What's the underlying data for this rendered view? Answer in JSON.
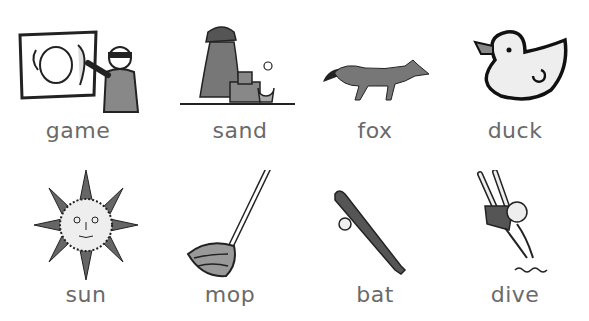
{
  "worksheet": {
    "items": [
      {
        "word": "game",
        "icon": "pin-the-tail-game-icon"
      },
      {
        "word": "sand",
        "icon": "sandcastle-icon"
      },
      {
        "word": "fox",
        "icon": "fox-icon"
      },
      {
        "word": "duck",
        "icon": "rubber-duck-icon"
      },
      {
        "word": "sun",
        "icon": "sun-face-icon"
      },
      {
        "word": "mop",
        "icon": "mop-icon"
      },
      {
        "word": "bat",
        "icon": "baseball-bat-icon"
      },
      {
        "word": "dive",
        "icon": "diver-icon"
      }
    ]
  }
}
